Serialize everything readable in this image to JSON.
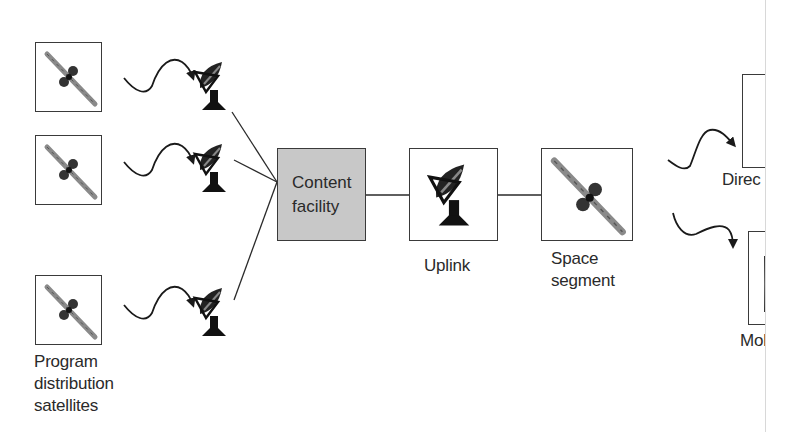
{
  "diagram": {
    "type": "satellite-broadcast-chain",
    "sources": {
      "label_lines": [
        "Program",
        "distribution",
        "satellites"
      ],
      "count": 3,
      "icon": "satellite-icon"
    },
    "receive_dishes": {
      "count": 3,
      "icon": "satellite-dish-icon"
    },
    "content_facility": {
      "label_lines": [
        "Content",
        "facility"
      ],
      "fill": "#c8c8c8"
    },
    "uplink": {
      "label": "Uplink",
      "icon": "satellite-dish-icon"
    },
    "space_segment": {
      "label_lines": [
        "Space",
        "segment"
      ],
      "icon": "satellite-icon"
    },
    "outputs": [
      {
        "label": "Direc",
        "note": "text clipped at page edge"
      },
      {
        "label": "Mob",
        "note": "text clipped at page edge"
      }
    ],
    "colors": {
      "stroke": "#2a2a2a",
      "box_border": "#3a3a3a",
      "facility_fill": "#c8c8c8",
      "background": "#ffffff"
    }
  }
}
